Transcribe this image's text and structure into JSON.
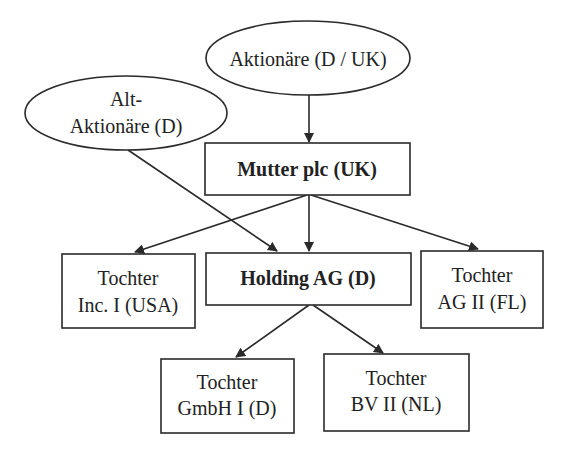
{
  "diagram": {
    "type": "ownership-structure",
    "colors": {
      "stroke": "#2a2a2a",
      "text": "#222222",
      "background": "#ffffff"
    },
    "nodes": {
      "aktionaere": {
        "shape": "ellipse",
        "lines": [
          "Aktionäre (D / UK)"
        ],
        "bold": false
      },
      "alt_aktionaere": {
        "shape": "ellipse",
        "lines": [
          "Alt-",
          "Aktionäre (D)"
        ],
        "bold": false
      },
      "mutter": {
        "shape": "rect",
        "lines": [
          "Mutter plc (UK)"
        ],
        "bold": true
      },
      "holding": {
        "shape": "rect",
        "lines": [
          "Holding AG (D)"
        ],
        "bold": true
      },
      "tochter_inc": {
        "shape": "rect",
        "lines": [
          "Tochter",
          "Inc. I (USA)"
        ],
        "bold": false
      },
      "tochter_ag": {
        "shape": "rect",
        "lines": [
          "Tochter",
          "AG II (FL)"
        ],
        "bold": false
      },
      "tochter_gmbh": {
        "shape": "rect",
        "lines": [
          "Tochter",
          "GmbH I (D)"
        ],
        "bold": false
      },
      "tochter_bv": {
        "shape": "rect",
        "lines": [
          "Tochter",
          "BV II (NL)"
        ],
        "bold": false
      }
    },
    "edges": [
      {
        "from": "aktionaere",
        "to": "mutter"
      },
      {
        "from": "alt_aktionaere",
        "to": "holding"
      },
      {
        "from": "mutter",
        "to": "tochter_inc"
      },
      {
        "from": "mutter",
        "to": "holding"
      },
      {
        "from": "mutter",
        "to": "tochter_ag"
      },
      {
        "from": "holding",
        "to": "tochter_gmbh"
      },
      {
        "from": "holding",
        "to": "tochter_bv"
      }
    ]
  }
}
